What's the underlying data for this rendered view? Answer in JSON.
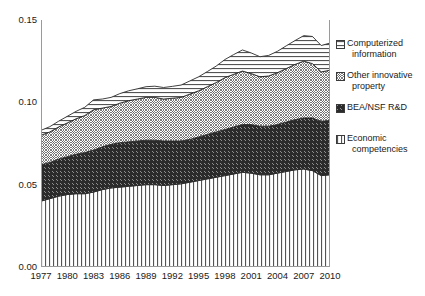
{
  "chart_data": {
    "type": "area",
    "stacked": true,
    "title": "",
    "subtitle": "",
    "xlabel": "",
    "ylabel": "",
    "xlim": [
      1977,
      2010
    ],
    "ylim": [
      0.0,
      0.15
    ],
    "grid": false,
    "legend_position": "right",
    "y_ticks": [
      "0.00",
      "0.05",
      "0.10",
      "0.15"
    ],
    "y_tick_values": [
      0.0,
      0.05,
      0.1,
      0.15
    ],
    "x_tick_labels": [
      "1977",
      "1980",
      "1983",
      "1986",
      "1989",
      "1992",
      "1995",
      "1998",
      "2001",
      "2004",
      "2007",
      "2010"
    ],
    "x_tick_values": [
      1977,
      1980,
      1983,
      1986,
      1989,
      1992,
      1995,
      1998,
      2001,
      2004,
      2007,
      2010
    ],
    "x": [
      1977,
      1978,
      1979,
      1980,
      1981,
      1982,
      1983,
      1984,
      1985,
      1986,
      1987,
      1988,
      1989,
      1990,
      1991,
      1992,
      1993,
      1994,
      1995,
      1996,
      1997,
      1998,
      1999,
      2000,
      2001,
      2002,
      2003,
      2004,
      2005,
      2006,
      2007,
      2008,
      2009,
      2010
    ],
    "series": [
      {
        "name": "Economic competencies",
        "pattern": "vertical-lines",
        "values": [
          0.04,
          0.0415,
          0.043,
          0.044,
          0.0445,
          0.0445,
          0.0455,
          0.047,
          0.048,
          0.0485,
          0.049,
          0.0495,
          0.05,
          0.05,
          0.0495,
          0.05,
          0.0505,
          0.0515,
          0.0525,
          0.0535,
          0.0545,
          0.0555,
          0.0565,
          0.0575,
          0.057,
          0.056,
          0.056,
          0.057,
          0.058,
          0.059,
          0.0595,
          0.0585,
          0.0555,
          0.056
        ]
      },
      {
        "name": "BEA/NSF R&D",
        "pattern": "diagonal-hatch",
        "values": [
          0.022,
          0.022,
          0.0225,
          0.023,
          0.024,
          0.025,
          0.0255,
          0.026,
          0.0265,
          0.027,
          0.027,
          0.027,
          0.027,
          0.027,
          0.027,
          0.0265,
          0.026,
          0.026,
          0.0265,
          0.027,
          0.0275,
          0.028,
          0.0285,
          0.029,
          0.0295,
          0.0295,
          0.0295,
          0.0295,
          0.03,
          0.0305,
          0.031,
          0.032,
          0.033,
          0.033
        ]
      },
      {
        "name": "Other innovative property",
        "pattern": "cross-hatch",
        "values": [
          0.018,
          0.0185,
          0.0195,
          0.0205,
          0.0215,
          0.0225,
          0.0245,
          0.0235,
          0.023,
          0.024,
          0.025,
          0.0255,
          0.026,
          0.026,
          0.0255,
          0.026,
          0.0265,
          0.0275,
          0.028,
          0.029,
          0.03,
          0.0315,
          0.032,
          0.0325,
          0.031,
          0.03,
          0.0305,
          0.0315,
          0.0325,
          0.0335,
          0.0345,
          0.033,
          0.03,
          0.0305
        ]
      },
      {
        "name": "Computerized information",
        "pattern": "horizontal-lines",
        "values": [
          0.003,
          0.0032,
          0.0035,
          0.004,
          0.0045,
          0.005,
          0.006,
          0.0055,
          0.0055,
          0.0058,
          0.006,
          0.0062,
          0.0065,
          0.0068,
          0.007,
          0.0072,
          0.0075,
          0.008,
          0.0085,
          0.0092,
          0.01,
          0.011,
          0.012,
          0.0128,
          0.0125,
          0.0122,
          0.0125,
          0.013,
          0.0138,
          0.0145,
          0.0155,
          0.0165,
          0.016,
          0.0165
        ]
      }
    ],
    "annotations": []
  },
  "legend": {
    "items": [
      {
        "label_line1": "Computerized",
        "label_line2": "information",
        "pattern": "horizontal-lines"
      },
      {
        "label_line1": "Other innovative",
        "label_line2": "property",
        "pattern": "cross-hatch"
      },
      {
        "label_line1": "BEA/NSF R&D",
        "label_line2": "",
        "pattern": "diagonal-hatch"
      },
      {
        "label_line1": "Economic",
        "label_line2": "competencies",
        "pattern": "vertical-lines"
      }
    ]
  },
  "colors": {
    "axis": "#9a9a9a",
    "line": "#2b2b2b",
    "text": "#1a1a1a",
    "background": "#ffffff"
  }
}
